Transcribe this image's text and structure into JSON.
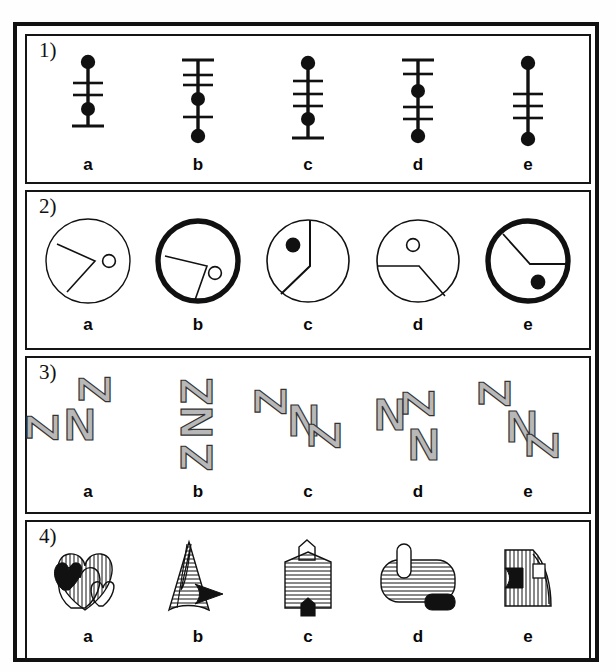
{
  "page": {
    "kind": "visual-reasoning-test-sheet",
    "background_color": "#ffffff",
    "ink_color": "#111111",
    "gray_fill": "#b8b8b8"
  },
  "rows": [
    {
      "number": "1)",
      "name": "row-1-line-tick-figures",
      "description": "vertical line figures with filled dots and cross ticks",
      "options": [
        {
          "label": "a",
          "elements": [
            {
              "type": "dot",
              "pos": 5
            },
            {
              "type": "tick",
              "pos": 28
            },
            {
              "type": "tick",
              "pos": 40
            },
            {
              "type": "dot",
              "pos": 54
            },
            {
              "type": "tick",
              "pos": 70
            }
          ]
        },
        {
          "label": "b",
          "elements": [
            {
              "type": "tick",
              "pos": 5
            },
            {
              "type": "tick",
              "pos": 20
            },
            {
              "type": "tick",
              "pos": 30
            },
            {
              "type": "dot",
              "pos": 44
            },
            {
              "type": "tick",
              "pos": 62
            },
            {
              "type": "dot",
              "pos": 80
            }
          ]
        },
        {
          "label": "c",
          "elements": [
            {
              "type": "dot",
              "pos": 6
            },
            {
              "type": "tick",
              "pos": 24
            },
            {
              "type": "tick",
              "pos": 38
            },
            {
              "type": "tick",
              "pos": 50
            },
            {
              "type": "dot",
              "pos": 64
            },
            {
              "type": "tick",
              "pos": 82
            }
          ]
        },
        {
          "label": "d",
          "elements": [
            {
              "type": "tick",
              "pos": 5
            },
            {
              "type": "tick",
              "pos": 18
            },
            {
              "type": "dot",
              "pos": 36
            },
            {
              "type": "tick",
              "pos": 52
            },
            {
              "type": "tick",
              "pos": 64
            },
            {
              "type": "dot",
              "pos": 80
            }
          ]
        },
        {
          "label": "e",
          "elements": [
            {
              "type": "dot",
              "pos": 6
            },
            {
              "type": "tick",
              "pos": 38
            },
            {
              "type": "tick",
              "pos": 50
            },
            {
              "type": "tick",
              "pos": 62
            },
            {
              "type": "dot",
              "pos": 84
            }
          ]
        }
      ]
    },
    {
      "number": "2)",
      "name": "row-2-circle-wedge-figures",
      "description": "circles containing a bent line wedge plus a small dot marker",
      "options": [
        {
          "label": "a",
          "outline": "thin",
          "marker": "hollow",
          "marker_x": 64,
          "marker_y": 46,
          "wedge": "M 16,30 L 50,46 L 26,74"
        },
        {
          "label": "b",
          "outline": "thick",
          "marker": "hollow",
          "marker_x": 63,
          "marker_y": 56,
          "wedge": "M 14,42 L 52,52 L 40,84"
        },
        {
          "label": "c",
          "outline": "thin",
          "marker": "filled",
          "marker_x": 32,
          "marker_y": 30,
          "wedge": "M 47,6 L 47,50 L 20,76"
        },
        {
          "label": "d",
          "outline": "thin",
          "marker": "hollow",
          "marker_x": 40,
          "marker_y": 30,
          "wedge": "M 5,50 L 45,50 L 70,80"
        },
        {
          "label": "e",
          "outline": "thick",
          "marker": "filled",
          "marker_x": 56,
          "marker_y": 64,
          "wedge": "M 22,20 L 47,48 L 84,48"
        }
      ]
    },
    {
      "number": "3)",
      "name": "row-3-letter-cluster-figures",
      "description": "clusters of three gray block letters N and Z at different rotations",
      "options": [
        {
          "label": "a",
          "letters": [
            {
              "glyph": "Z",
              "rot": -90,
              "x": 58,
              "y": 14
            },
            {
              "glyph": "N",
              "rot": 0,
              "x": 32,
              "y": 32
            },
            {
              "glyph": "Z",
              "rot": -90,
              "x": 2,
              "y": 44
            }
          ]
        },
        {
          "label": "b",
          "letters": [
            {
              "glyph": "Z",
              "rot": -90,
              "x": 36,
              "y": 2
            },
            {
              "glyph": "N",
              "rot": -90,
              "x": 36,
              "y": 32
            },
            {
              "glyph": "Z",
              "rot": -90,
              "x": 36,
              "y": 62
            }
          ]
        },
        {
          "label": "c",
          "letters": [
            {
              "glyph": "Z",
              "rot": -90,
              "x": 4,
              "y": 16
            },
            {
              "glyph": "N",
              "rot": 0,
              "x": 34,
              "y": 28
            },
            {
              "glyph": "Z",
              "rot": -90,
              "x": 60,
              "y": 46
            }
          ]
        },
        {
          "label": "d",
          "letters": [
            {
              "glyph": "N",
              "rot": 0,
              "x": 6,
              "y": 16
            },
            {
              "glyph": "Z",
              "rot": -90,
              "x": 36,
              "y": 14
            },
            {
              "glyph": "N",
              "rot": 0,
              "x": 40,
              "y": 42
            }
          ]
        },
        {
          "label": "e",
          "letters": [
            {
              "glyph": "Z",
              "rot": -90,
              "x": 8,
              "y": 4
            },
            {
              "glyph": "N",
              "rot": 0,
              "x": 32,
              "y": 30
            },
            {
              "glyph": "Z",
              "rot": -90,
              "x": 56,
              "y": 52
            }
          ]
        }
      ]
    },
    {
      "number": "4)",
      "name": "row-4-hatched-shape-figures",
      "description": "line-hatched outline shapes each with a small solid black attachment",
      "options": [
        {
          "label": "a",
          "shape": "overlapping-hearts",
          "hatch": "vertical"
        },
        {
          "label": "b",
          "shape": "tall-triangle",
          "hatch": "horizontal"
        },
        {
          "label": "c",
          "shape": "house-pentagon",
          "hatch": "horizontal"
        },
        {
          "label": "d",
          "shape": "rounded-barrel",
          "hatch": "horizontal"
        },
        {
          "label": "e",
          "shape": "quarter-fan",
          "hatch": "vertical"
        }
      ]
    }
  ]
}
